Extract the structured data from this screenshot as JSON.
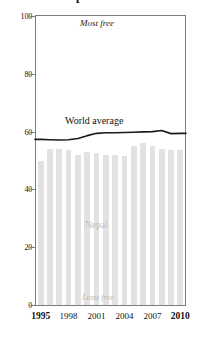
{
  "chart_data": {
    "type": "bar",
    "title": "Nepal",
    "xlabel": "",
    "ylabel": "",
    "ylim": [
      0,
      100
    ],
    "xlim": [
      1994.5,
      2010.5
    ],
    "grid": false,
    "legend_position": "inline-annotations",
    "categories": [
      1995,
      1996,
      1997,
      1998,
      1999,
      2000,
      2001,
      2002,
      2003,
      2004,
      2005,
      2006,
      2007,
      2008,
      2009,
      2010
    ],
    "yticks": [
      0,
      20,
      40,
      60,
      80,
      100
    ],
    "ytick_labels": [
      "0",
      "20",
      "40",
      "60",
      "80",
      "100"
    ],
    "xticks": [
      1995,
      1998,
      2001,
      2004,
      2007,
      2010
    ],
    "xtick_labels": [
      "1995",
      "1998",
      "2001",
      "2004",
      "2007",
      "2010"
    ],
    "series": [
      {
        "name": "Nepal",
        "type": "bar",
        "color": "#e2e2e2",
        "values": [
          50.0,
          54.0,
          54.0,
          53.5,
          52.0,
          53.0,
          52.5,
          52.0,
          52.0,
          51.5,
          55.0,
          56.0,
          55.0,
          54.0,
          53.5,
          53.5
        ]
      },
      {
        "name": "World average",
        "type": "line",
        "color": "#1a1a1a",
        "values": [
          57.3,
          57.2,
          57.1,
          57.2,
          57.6,
          58.6,
          59.4,
          59.6,
          59.6,
          59.7,
          59.8,
          59.9,
          60.0,
          60.4,
          59.3,
          59.4
        ]
      }
    ],
    "annotations": [
      {
        "name": "most-free",
        "text": "Most free",
        "x": 2001,
        "y": 97
      },
      {
        "name": "least-free",
        "text": "Least free",
        "x": 2001,
        "y": 2
      },
      {
        "name": "nepal-label",
        "text": "Nepal",
        "x": 2002,
        "y": 27
      },
      {
        "name": "world-average-label",
        "text": "World average",
        "x": 2000,
        "y": 65
      }
    ]
  },
  "axes": {
    "y_labels": [
      "100",
      "80",
      "60",
      "40",
      "20",
      "0"
    ],
    "x_labels": [
      {
        "text": "1995",
        "bold": true
      },
      {
        "text": "1998",
        "bold": false
      },
      {
        "text": "2001",
        "bold": false
      },
      {
        "text": "2004",
        "bold": false
      },
      {
        "text": "2007",
        "bold": false
      },
      {
        "text": "2010",
        "bold": true
      }
    ]
  },
  "labels": {
    "most_free": "Most free",
    "least_free": "Least free",
    "nepal": "Nepal",
    "world_average": "World average",
    "title_fragment": "Nepal"
  },
  "colors": {
    "bar": "#e2e2e2",
    "line": "#1a1a1a",
    "frame": "#7c7c7c",
    "background": "#ffffff",
    "nepal_label": "#c0c0c0",
    "least_free_label": "#b9b9b9"
  }
}
